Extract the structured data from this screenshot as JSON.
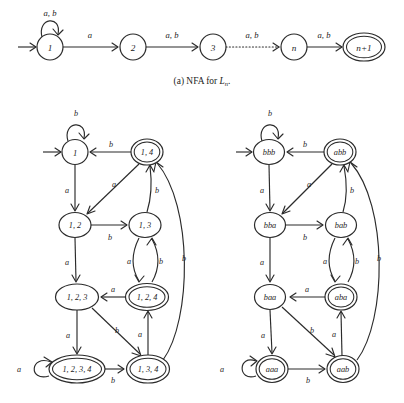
{
  "figure": {
    "caption_a": "(a) NFA for Ln.",
    "caption_a_prefix": "(a) NFA for ",
    "caption_a_italic": "L",
    "caption_a_sub": "n",
    "caption_a_suffix": "."
  },
  "nfa": {
    "name": "NFA for Ln",
    "alphabet": [
      "a",
      "b"
    ],
    "start_state": "1",
    "accept_states": [
      "n+1"
    ],
    "states": [
      {
        "id": "s1",
        "label": "1",
        "x": 50,
        "y": 47,
        "rx": 13,
        "ry": 13,
        "accepting": false,
        "start": true
      },
      {
        "id": "s2",
        "label": "2",
        "x": 133,
        "y": 47,
        "rx": 13,
        "ry": 13,
        "accepting": false,
        "start": false
      },
      {
        "id": "s3",
        "label": "3",
        "x": 213,
        "y": 47,
        "rx": 13,
        "ry": 13,
        "accepting": false,
        "start": false
      },
      {
        "id": "sn",
        "label": "n",
        "x": 294,
        "y": 47,
        "rx": 13,
        "ry": 13,
        "accepting": false,
        "start": false
      },
      {
        "id": "sn1",
        "label": "n+1",
        "x": 364,
        "y": 47,
        "rx": 20,
        "ry": 13,
        "accepting": true,
        "start": false
      }
    ],
    "transitions": [
      {
        "from": "s1",
        "to": "s1",
        "label": "a, b",
        "kind": "self-loop"
      },
      {
        "from": "s1",
        "to": "s2",
        "label": "a",
        "kind": "straight"
      },
      {
        "from": "s2",
        "to": "s3",
        "label": "a, b",
        "kind": "straight"
      },
      {
        "from": "s3",
        "to": "sn",
        "label": "a, b",
        "kind": "dotted"
      },
      {
        "from": "sn",
        "to": "sn1",
        "label": "a, b",
        "kind": "straight"
      }
    ]
  },
  "dfa_subset": {
    "name": "DFA subset-construction states",
    "start_state": "1",
    "states": [
      {
        "id": "q1",
        "label": "1",
        "x": 75,
        "y": 152,
        "rx": 13,
        "ry": 12.5,
        "accepting": false,
        "start": true
      },
      {
        "id": "q14",
        "label": "1, 4",
        "x": 147,
        "y": 152,
        "rx": 16,
        "ry": 12.5,
        "accepting": true,
        "start": false
      },
      {
        "id": "q12",
        "label": "1, 2",
        "x": 75,
        "y": 225,
        "rx": 16,
        "ry": 12.5,
        "accepting": false,
        "start": false
      },
      {
        "id": "q13",
        "label": "1, 3",
        "x": 145,
        "y": 225,
        "rx": 16,
        "ry": 12.5,
        "accepting": false,
        "start": false
      },
      {
        "id": "q123",
        "label": "1, 2, 3",
        "x": 77,
        "y": 297,
        "rx": 21.5,
        "ry": 13,
        "accepting": false,
        "start": false
      },
      {
        "id": "q124",
        "label": "1, 2, 4",
        "x": 147,
        "y": 297,
        "rx": 21.5,
        "ry": 13,
        "accepting": true,
        "start": false
      },
      {
        "id": "q1234",
        "label": "1, 2, 3, 4",
        "x": 77,
        "y": 369,
        "rx": 28,
        "ry": 13.5,
        "accepting": true,
        "start": false
      },
      {
        "id": "q134",
        "label": "1, 3, 4",
        "x": 148,
        "y": 369,
        "rx": 21.5,
        "ry": 13.5,
        "accepting": true,
        "start": false
      }
    ],
    "transitions": [
      {
        "from": "q1",
        "to": "q1",
        "label": "b",
        "label_x": 76,
        "label_y": 113
      },
      {
        "from": "q14",
        "to": "q1",
        "label": "b",
        "label_x": 111,
        "label_y": 144
      },
      {
        "from": "q1",
        "to": "q12",
        "label": "a",
        "label_x": 67,
        "label_y": 190
      },
      {
        "from": "q14",
        "to": "q12",
        "label": "a",
        "label_x": 114,
        "label_y": 184
      },
      {
        "from": "q12",
        "to": "q13",
        "label": "b",
        "label_x": 110,
        "label_y": 237
      },
      {
        "from": "q13",
        "to": "q14",
        "label": "b",
        "label_x": 156,
        "label_y": 190
      },
      {
        "from": "q12",
        "to": "q123",
        "label": "a",
        "label_x": 67,
        "label_y": 262
      },
      {
        "from": "q13",
        "to": "q124",
        "label": "a",
        "label_x": 131,
        "label_y": 261
      },
      {
        "from": "q124",
        "to": "q13",
        "label": "b",
        "label_x": 159,
        "label_y": 261
      },
      {
        "from": "q124",
        "to": "q123",
        "label": "a",
        "label_x": 113,
        "label_y": 289
      },
      {
        "from": "q123",
        "to": "q1234",
        "label": "a",
        "label_x": 68,
        "label_y": 335
      },
      {
        "from": "q123",
        "to": "q134",
        "label": "b",
        "label_x": 117,
        "label_y": 330
      },
      {
        "from": "q134",
        "to": "q124",
        "label": "a",
        "label_x": 140,
        "label_y": 334
      },
      {
        "from": "q1234",
        "to": "q1234",
        "label": "a",
        "label_x": 19,
        "label_y": 369
      },
      {
        "from": "q1234",
        "to": "q134",
        "label": "b",
        "label_x": 113,
        "label_y": 379
      },
      {
        "from": "q134",
        "to": "q14",
        "label": "b",
        "label_x": 183,
        "label_y": 258
      }
    ]
  },
  "dfa_named": {
    "name": "DFA with renamed states",
    "start_state": "bbb",
    "states": [
      {
        "id": "n_bbb",
        "label": "bbb",
        "x": 269,
        "y": 152,
        "rx": 15.5,
        "ry": 12.5,
        "accepting": false,
        "start": true
      },
      {
        "id": "n_abb",
        "label": "abb",
        "x": 340,
        "y": 152,
        "rx": 15.5,
        "ry": 12.5,
        "accepting": true,
        "start": false
      },
      {
        "id": "n_bba",
        "label": "bba",
        "x": 270,
        "y": 225,
        "rx": 15.5,
        "ry": 12.5,
        "accepting": false,
        "start": false
      },
      {
        "id": "n_bab",
        "label": "bab",
        "x": 341,
        "y": 225,
        "rx": 15.5,
        "ry": 12.5,
        "accepting": false,
        "start": false
      },
      {
        "id": "n_baa",
        "label": "baa",
        "x": 270,
        "y": 297,
        "rx": 15.5,
        "ry": 12.5,
        "accepting": false,
        "start": false
      },
      {
        "id": "n_aba",
        "label": "aba",
        "x": 341,
        "y": 297,
        "rx": 15.5,
        "ry": 12.5,
        "accepting": true,
        "start": false
      },
      {
        "id": "n_aaa",
        "label": "aaa",
        "x": 272,
        "y": 369,
        "rx": 15.5,
        "ry": 13,
        "accepting": true,
        "start": false
      },
      {
        "id": "n_aab",
        "label": "aab",
        "x": 343,
        "y": 369,
        "rx": 15.5,
        "ry": 13,
        "accepting": true,
        "start": false
      }
    ],
    "transitions": [
      {
        "from": "n_bbb",
        "to": "n_bbb",
        "label": "b",
        "label_x": 270,
        "label_y": 113
      },
      {
        "from": "n_abb",
        "to": "n_bbb",
        "label": "b",
        "label_x": 305,
        "label_y": 144
      },
      {
        "from": "n_bbb",
        "to": "n_bba",
        "label": "a",
        "label_x": 262,
        "label_y": 190
      },
      {
        "from": "n_abb",
        "to": "n_bba",
        "label": "a",
        "label_x": 309,
        "label_y": 184
      },
      {
        "from": "n_bba",
        "to": "n_bab",
        "label": "b",
        "label_x": 305,
        "label_y": 237
      },
      {
        "from": "n_bab",
        "to": "n_abb",
        "label": "b",
        "label_x": 351,
        "label_y": 190
      },
      {
        "from": "n_bba",
        "to": "n_baa",
        "label": "a",
        "label_x": 262,
        "label_y": 262
      },
      {
        "from": "n_bab",
        "to": "n_aba",
        "label": "a",
        "label_x": 327,
        "label_y": 261
      },
      {
        "from": "n_aba",
        "to": "n_bab",
        "label": "b",
        "label_x": 355,
        "label_y": 261
      },
      {
        "from": "n_aba",
        "to": "n_baa",
        "label": "a",
        "label_x": 307,
        "label_y": 289
      },
      {
        "from": "n_baa",
        "to": "n_aaa",
        "label": "a",
        "label_x": 263,
        "label_y": 335
      },
      {
        "from": "n_baa",
        "to": "n_aab",
        "label": "b",
        "label_x": 312,
        "label_y": 330
      },
      {
        "from": "n_aab",
        "to": "n_aba",
        "label": "a",
        "label_x": 335,
        "label_y": 334
      },
      {
        "from": "n_aaa",
        "to": "n_aaa",
        "label": "a",
        "label_x": 222,
        "label_y": 369
      },
      {
        "from": "n_aaa",
        "to": "n_aab",
        "label": "b",
        "label_x": 308,
        "label_y": 379
      },
      {
        "from": "n_aab",
        "to": "n_abb",
        "label": "b",
        "label_x": 379,
        "label_y": 258
      }
    ]
  }
}
